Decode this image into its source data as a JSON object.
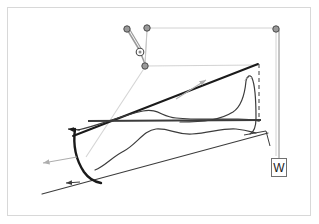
{
  "figure": {
    "background_color": "#ffffff",
    "frame_color": "#d8d8d8",
    "labels": {
      "w_label": "W"
    },
    "colors": {
      "heavy_stroke": "#1a1a1a",
      "medium_stroke": "#3c3c3c",
      "light_stroke": "#8c8c8c",
      "very_light_stroke": "#c6c6c6",
      "node_fill": "#9a9a9a",
      "node_stroke": "#4a4a4a",
      "arrow_gray": "#aeaeae",
      "box_border": "#707070"
    },
    "nodes": [
      {
        "name": "node-top-left",
        "cx": 127,
        "cy": 29,
        "r": 3.2
      },
      {
        "name": "node-top-mid",
        "cx": 147,
        "cy": 28,
        "r": 3.2
      },
      {
        "name": "node-top-right",
        "cx": 276,
        "cy": 29,
        "r": 3.2
      },
      {
        "name": "node-ring",
        "cx": 140,
        "cy": 52,
        "r": 3.6
      },
      {
        "name": "node-lower",
        "cx": 145,
        "cy": 66,
        "r": 3.2
      }
    ],
    "arrows": [
      {
        "name": "arrow-upslope",
        "x1": 176,
        "y1": 99,
        "x2": 206,
        "y2": 80,
        "color": "#aeaeae"
      },
      {
        "name": "arrow-downslope",
        "x1": 75,
        "y1": 157,
        "x2": 41,
        "y2": 164,
        "color": "#aeaeae"
      },
      {
        "name": "arrow-arc-head",
        "x1": 78,
        "y1": 130,
        "x2": 68,
        "y2": 130,
        "color": "#1a1a1a"
      },
      {
        "name": "arrow-base-head",
        "x1": 78,
        "y1": 182,
        "x2": 66,
        "y2": 183,
        "color": "#3c3c3c"
      }
    ],
    "elements": [
      {
        "name": "upper-rectangle-guide",
        "type": "polyline",
        "color": "#c6c6c6"
      },
      {
        "name": "incline-upper-line",
        "type": "line",
        "color": "#1a1a1a"
      },
      {
        "name": "incline-lower-line",
        "type": "line",
        "color": "#3c3c3c"
      },
      {
        "name": "horizontal-datum-line",
        "type": "line",
        "color": "#3c3c3c"
      },
      {
        "name": "wave-profile-upper",
        "type": "path",
        "color": "#3c3c3c"
      },
      {
        "name": "wave-profile-lower",
        "type": "path",
        "color": "#3c3c3c"
      },
      {
        "name": "breaking-wave-arc",
        "type": "path",
        "color": "#1a1a1a"
      },
      {
        "name": "right-surge-curve",
        "type": "path",
        "color": "#3c3c3c"
      },
      {
        "name": "dashed-vertical-right",
        "type": "line",
        "color": "#3c3c3c",
        "dashed": true
      },
      {
        "name": "leader-line-to-w",
        "type": "line",
        "color": "#8c8c8c"
      },
      {
        "name": "bracket-right",
        "type": "polyline",
        "color": "#3c3c3c"
      },
      {
        "name": "tether-line-long",
        "type": "line",
        "color": "#d0d0d0"
      }
    ]
  }
}
